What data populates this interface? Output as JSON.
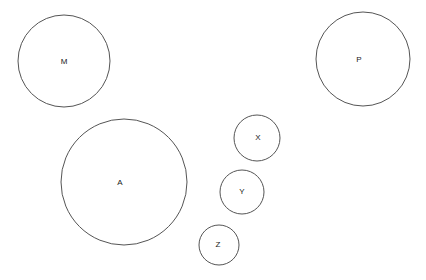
{
  "canvas": {
    "width": 426,
    "height": 280,
    "background_color": "#ffffff",
    "stroke_color": "#555555",
    "stroke_width": 1,
    "label_color": "#1a1a1a",
    "label_font_size": 8
  },
  "chart_data": {
    "type": "scatter",
    "title": "",
    "subtitle": "",
    "xlabel": "",
    "ylabel": "",
    "xlim": [
      0,
      426
    ],
    "ylim": [
      0,
      280
    ],
    "grid": false,
    "axes_visible": false,
    "legend": false,
    "legend_position": "none",
    "marker_style": "open-circle",
    "annotations": [],
    "points": [
      {
        "label": "M",
        "cx": 64,
        "cy": 61,
        "r": 46,
        "label_x": 64,
        "label_y": 62
      },
      {
        "label": "P",
        "cx": 363,
        "cy": 59,
        "r": 47,
        "label_x": 359,
        "label_y": 60
      },
      {
        "label": "A",
        "cx": 124,
        "cy": 182,
        "r": 63,
        "label_x": 120,
        "label_y": 183
      },
      {
        "label": "X",
        "cx": 257,
        "cy": 138,
        "r": 23,
        "label_x": 258,
        "label_y": 138
      },
      {
        "label": "Y",
        "cx": 242,
        "cy": 192,
        "r": 22,
        "label_x": 242,
        "label_y": 192
      },
      {
        "label": "Z",
        "cx": 219,
        "cy": 245,
        "r": 20,
        "label_x": 218,
        "label_y": 245
      }
    ]
  }
}
